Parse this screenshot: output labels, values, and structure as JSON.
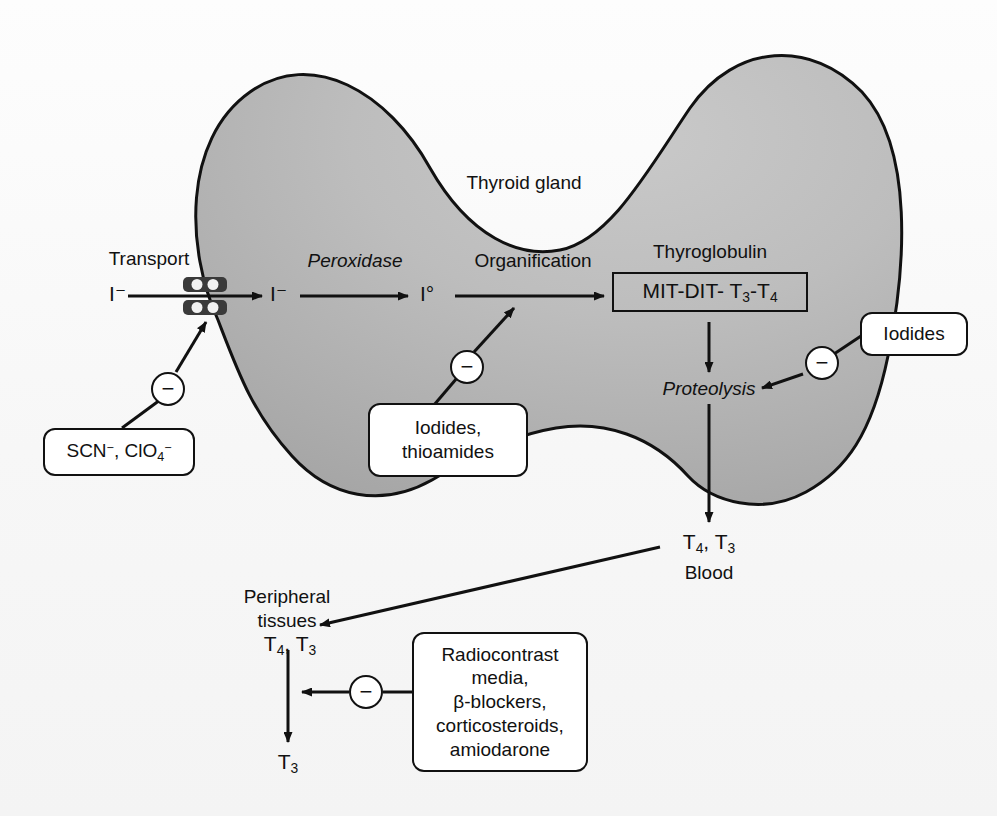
{
  "figure": {
    "gland_label": "Thyroid gland",
    "background_color": "#fbfbfb",
    "gland_fill_light": "#d8d8d8",
    "gland_fill_dark": "#9a9a9a",
    "stroke_color": "#111111"
  },
  "steps": {
    "transport": "Transport",
    "peroxidase": "Peroxidase",
    "organification": "Organification",
    "thyroglobulin": "Thyroglobulin",
    "proteolysis": "Proteolysis",
    "blood": "Blood",
    "peripheral_tissues_line1": "Peripheral",
    "peripheral_tissues_line2": "tissues"
  },
  "species": {
    "iodide_outside": "I⁻",
    "iodide_inside": "I⁻",
    "iodine_oxidized": "I°",
    "thyroglobulin_contents": "MIT-DIT- T3-T4",
    "hormones_blood": "T4, T3",
    "hormones_tissue": "T4, T3",
    "hormone_product": "T3"
  },
  "inhibitors": [
    {
      "id": "anion-transport-inhibitors",
      "text": "SCN⁻, ClO₄⁻",
      "target": "transport",
      "sign": "−"
    },
    {
      "id": "organification-inhibitors",
      "line1": "Iodides,",
      "line2": "thioamides",
      "target": "organification",
      "sign": "−"
    },
    {
      "id": "proteolysis-inhibitors",
      "text": "Iodides",
      "target": "proteolysis",
      "sign": "−"
    },
    {
      "id": "peripheral-conversion-inhibitors",
      "line1": "Radiocontrast",
      "line2": "media,",
      "line3": "β-blockers,",
      "line4": "corticosteroids,",
      "line5": "amiodarone",
      "target": "peripheral-deiodination",
      "sign": "−"
    }
  ],
  "icons": {
    "transporter": "membrane-transporter-icon",
    "minus_sign": "−"
  }
}
